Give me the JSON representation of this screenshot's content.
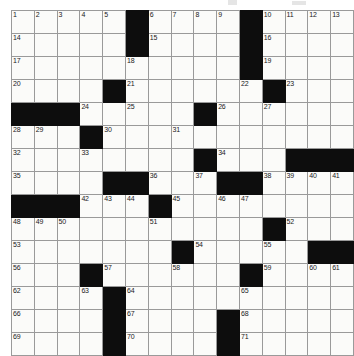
{
  "puzzle": {
    "title": "Crossword Puzzle Grid",
    "rows": 15,
    "cols": 15,
    "colors": {
      "block": "#0d0d0d",
      "cell": "#fbfbf9",
      "gridline": "#9a9a9a",
      "number": "#1a1a1a",
      "page": "#ffffff"
    },
    "grid": [
      [
        {
          "n": "1",
          "b": false
        },
        {
          "n": "2",
          "b": false
        },
        {
          "n": "3",
          "b": false
        },
        {
          "n": "4",
          "b": false
        },
        {
          "n": "5",
          "b": false
        },
        {
          "n": "",
          "b": true
        },
        {
          "n": "6",
          "b": false
        },
        {
          "n": "7",
          "b": false
        },
        {
          "n": "8",
          "b": false
        },
        {
          "n": "9",
          "b": false
        },
        {
          "n": "",
          "b": true
        },
        {
          "n": "10",
          "b": false
        },
        {
          "n": "11",
          "b": false
        },
        {
          "n": "12",
          "b": false
        },
        {
          "n": "13",
          "b": false
        }
      ],
      [
        {
          "n": "14",
          "b": false
        },
        {
          "n": "",
          "b": false
        },
        {
          "n": "",
          "b": false
        },
        {
          "n": "",
          "b": false
        },
        {
          "n": "",
          "b": false
        },
        {
          "n": "",
          "b": true
        },
        {
          "n": "15",
          "b": false
        },
        {
          "n": "",
          "b": false
        },
        {
          "n": "",
          "b": false
        },
        {
          "n": "",
          "b": false
        },
        {
          "n": "",
          "b": true
        },
        {
          "n": "16",
          "b": false
        },
        {
          "n": "",
          "b": false
        },
        {
          "n": "",
          "b": false
        },
        {
          "n": "",
          "b": false
        }
      ],
      [
        {
          "n": "17",
          "b": false
        },
        {
          "n": "",
          "b": false
        },
        {
          "n": "",
          "b": false
        },
        {
          "n": "",
          "b": false
        },
        {
          "n": "",
          "b": false
        },
        {
          "n": "18",
          "b": false
        },
        {
          "n": "",
          "b": false
        },
        {
          "n": "",
          "b": false
        },
        {
          "n": "",
          "b": false
        },
        {
          "n": "",
          "b": false
        },
        {
          "n": "",
          "b": true
        },
        {
          "n": "19",
          "b": false
        },
        {
          "n": "",
          "b": false
        },
        {
          "n": "",
          "b": false
        },
        {
          "n": "",
          "b": false
        }
      ],
      [
        {
          "n": "20",
          "b": false
        },
        {
          "n": "",
          "b": false
        },
        {
          "n": "",
          "b": false
        },
        {
          "n": "",
          "b": false
        },
        {
          "n": "",
          "b": true
        },
        {
          "n": "21",
          "b": false
        },
        {
          "n": "",
          "b": false
        },
        {
          "n": "",
          "b": false
        },
        {
          "n": "",
          "b": false
        },
        {
          "n": "",
          "b": false
        },
        {
          "n": "22",
          "b": false
        },
        {
          "n": "",
          "b": true
        },
        {
          "n": "23",
          "b": false
        },
        {
          "n": "",
          "b": false
        },
        {
          "n": "",
          "b": false
        }
      ],
      [
        {
          "n": "",
          "b": true
        },
        {
          "n": "",
          "b": true
        },
        {
          "n": "",
          "b": true
        },
        {
          "n": "24",
          "b": false
        },
        {
          "n": "",
          "b": false
        },
        {
          "n": "25",
          "b": false
        },
        {
          "n": "",
          "b": false
        },
        {
          "n": "",
          "b": false
        },
        {
          "n": "",
          "b": true
        },
        {
          "n": "26",
          "b": false
        },
        {
          "n": "",
          "b": false
        },
        {
          "n": "27",
          "b": false
        },
        {
          "n": "",
          "b": false
        },
        {
          "n": "",
          "b": false
        },
        {
          "n": "",
          "b": false
        }
      ],
      [
        {
          "n": "28",
          "b": false
        },
        {
          "n": "29",
          "b": false
        },
        {
          "n": "",
          "b": false
        },
        {
          "n": "",
          "b": true
        },
        {
          "n": "30",
          "b": false
        },
        {
          "n": "",
          "b": false
        },
        {
          "n": "",
          "b": false
        },
        {
          "n": "31",
          "b": false
        },
        {
          "n": "",
          "b": false
        },
        {
          "n": "",
          "b": false
        },
        {
          "n": "",
          "b": false
        },
        {
          "n": "",
          "b": false
        },
        {
          "n": "",
          "b": false
        },
        {
          "n": "",
          "b": false
        },
        {
          "n": "",
          "b": false
        }
      ],
      [
        {
          "n": "32",
          "b": false
        },
        {
          "n": "",
          "b": false
        },
        {
          "n": "",
          "b": false
        },
        {
          "n": "33",
          "b": false
        },
        {
          "n": "",
          "b": false
        },
        {
          "n": "",
          "b": false
        },
        {
          "n": "",
          "b": false
        },
        {
          "n": "",
          "b": false
        },
        {
          "n": "",
          "b": true
        },
        {
          "n": "34",
          "b": false
        },
        {
          "n": "",
          "b": false
        },
        {
          "n": "",
          "b": false
        },
        {
          "n": "",
          "b": true
        },
        {
          "n": "",
          "b": true
        },
        {
          "n": "",
          "b": true
        }
      ],
      [
        {
          "n": "35",
          "b": false
        },
        {
          "n": "",
          "b": false
        },
        {
          "n": "",
          "b": false
        },
        {
          "n": "",
          "b": false
        },
        {
          "n": "",
          "b": true
        },
        {
          "n": "",
          "b": true
        },
        {
          "n": "36",
          "b": false
        },
        {
          "n": "",
          "b": false
        },
        {
          "n": "37",
          "b": false
        },
        {
          "n": "",
          "b": true
        },
        {
          "n": "",
          "b": true
        },
        {
          "n": "38",
          "b": false
        },
        {
          "n": "39",
          "b": false
        },
        {
          "n": "40",
          "b": false
        },
        {
          "n": "41",
          "b": false
        }
      ],
      [
        {
          "n": "",
          "b": true
        },
        {
          "n": "",
          "b": true
        },
        {
          "n": "",
          "b": true
        },
        {
          "n": "42",
          "b": false
        },
        {
          "n": "43",
          "b": false
        },
        {
          "n": "44",
          "b": false
        },
        {
          "n": "",
          "b": true
        },
        {
          "n": "45",
          "b": false
        },
        {
          "n": "",
          "b": false
        },
        {
          "n": "46",
          "b": false
        },
        {
          "n": "47",
          "b": false
        },
        {
          "n": "",
          "b": false
        },
        {
          "n": "",
          "b": false
        },
        {
          "n": "",
          "b": false
        },
        {
          "n": "",
          "b": false
        }
      ],
      [
        {
          "n": "48",
          "b": false
        },
        {
          "n": "49",
          "b": false
        },
        {
          "n": "50",
          "b": false
        },
        {
          "n": "",
          "b": false
        },
        {
          "n": "",
          "b": false
        },
        {
          "n": "",
          "b": false
        },
        {
          "n": "51",
          "b": false
        },
        {
          "n": "",
          "b": false
        },
        {
          "n": "",
          "b": false
        },
        {
          "n": "",
          "b": false
        },
        {
          "n": "",
          "b": false
        },
        {
          "n": "",
          "b": true
        },
        {
          "n": "52",
          "b": false
        },
        {
          "n": "",
          "b": false
        },
        {
          "n": "",
          "b": false
        }
      ],
      [
        {
          "n": "53",
          "b": false
        },
        {
          "n": "",
          "b": false
        },
        {
          "n": "",
          "b": false
        },
        {
          "n": "",
          "b": false
        },
        {
          "n": "",
          "b": false
        },
        {
          "n": "",
          "b": false
        },
        {
          "n": "",
          "b": false
        },
        {
          "n": "",
          "b": true
        },
        {
          "n": "54",
          "b": false
        },
        {
          "n": "",
          "b": false
        },
        {
          "n": "",
          "b": false
        },
        {
          "n": "55",
          "b": false
        },
        {
          "n": "",
          "b": false
        },
        {
          "n": "",
          "b": true
        },
        {
          "n": "",
          "b": true
        }
      ],
      [
        {
          "n": "56",
          "b": false
        },
        {
          "n": "",
          "b": false
        },
        {
          "n": "",
          "b": false
        },
        {
          "n": "",
          "b": true
        },
        {
          "n": "57",
          "b": false
        },
        {
          "n": "",
          "b": false
        },
        {
          "n": "",
          "b": false
        },
        {
          "n": "58",
          "b": false
        },
        {
          "n": "",
          "b": false
        },
        {
          "n": "",
          "b": false
        },
        {
          "n": "",
          "b": true
        },
        {
          "n": "59",
          "b": false
        },
        {
          "n": "",
          "b": false
        },
        {
          "n": "60",
          "b": false
        },
        {
          "n": "61",
          "b": false
        }
      ],
      [
        {
          "n": "62",
          "b": false
        },
        {
          "n": "",
          "b": false
        },
        {
          "n": "",
          "b": false
        },
        {
          "n": "63",
          "b": false
        },
        {
          "n": "",
          "b": true
        },
        {
          "n": "64",
          "b": false
        },
        {
          "n": "",
          "b": false
        },
        {
          "n": "",
          "b": false
        },
        {
          "n": "",
          "b": false
        },
        {
          "n": "",
          "b": false
        },
        {
          "n": "65",
          "b": false
        },
        {
          "n": "",
          "b": false
        },
        {
          "n": "",
          "b": false
        },
        {
          "n": "",
          "b": false
        },
        {
          "n": "",
          "b": false
        }
      ],
      [
        {
          "n": "66",
          "b": false
        },
        {
          "n": "",
          "b": false
        },
        {
          "n": "",
          "b": false
        },
        {
          "n": "",
          "b": false
        },
        {
          "n": "",
          "b": true
        },
        {
          "n": "67",
          "b": false
        },
        {
          "n": "",
          "b": false
        },
        {
          "n": "",
          "b": false
        },
        {
          "n": "",
          "b": false
        },
        {
          "n": "",
          "b": true
        },
        {
          "n": "68",
          "b": false
        },
        {
          "n": "",
          "b": false
        },
        {
          "n": "",
          "b": false
        },
        {
          "n": "",
          "b": false
        },
        {
          "n": "",
          "b": false
        }
      ],
      [
        {
          "n": "69",
          "b": false
        },
        {
          "n": "",
          "b": false
        },
        {
          "n": "",
          "b": false
        },
        {
          "n": "",
          "b": false
        },
        {
          "n": "",
          "b": true
        },
        {
          "n": "70",
          "b": false
        },
        {
          "n": "",
          "b": false
        },
        {
          "n": "",
          "b": false
        },
        {
          "n": "",
          "b": false
        },
        {
          "n": "",
          "b": true
        },
        {
          "n": "71",
          "b": false
        },
        {
          "n": "",
          "b": false
        },
        {
          "n": "",
          "b": false
        },
        {
          "n": "",
          "b": false
        },
        {
          "n": "",
          "b": false
        }
      ]
    ]
  }
}
